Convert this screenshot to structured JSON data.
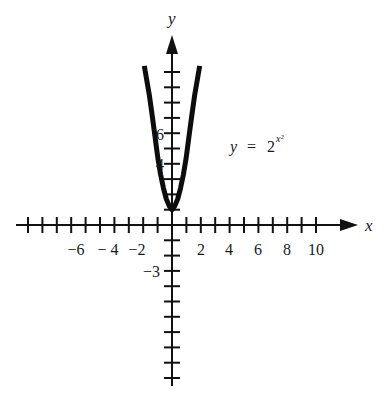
{
  "chart_data": {
    "type": "line",
    "title": "",
    "equation_label": {
      "lhs": "y",
      "eq": "=",
      "base": "2",
      "exponent": "x²"
    },
    "function": "y = 2^(x^2)",
    "xlabel": "x",
    "ylabel": "y",
    "x_tick_labels": [
      "−6",
      "− 4",
      "−2",
      "2",
      "4",
      "6",
      "8",
      "10"
    ],
    "x_tick_label_values": [
      -6,
      -4,
      -2,
      2,
      4,
      6,
      8,
      10
    ],
    "y_tick_labels": [
      "6",
      "4",
      "−3"
    ],
    "y_tick_label_values": [
      6,
      4,
      -2
    ],
    "x_ticks": [
      -10,
      -9,
      -8,
      -7,
      -6,
      -5,
      -4,
      -3,
      -2,
      -1,
      1,
      2,
      3,
      4,
      5,
      6,
      7,
      8,
      9,
      10
    ],
    "y_ticks": [
      -10,
      -9,
      -8,
      -7,
      -6,
      -5,
      -4,
      -3,
      -2,
      -1,
      1,
      2,
      3,
      4,
      5,
      6,
      7,
      8,
      9,
      10
    ],
    "xlim": [
      -10.5,
      12.5
    ],
    "ylim": [
      -10.5,
      12.5
    ],
    "grid": false,
    "legend": null,
    "series": [
      {
        "name": "y = 2^(x^2)",
        "x": [
          -1.95,
          -1.8,
          -1.6,
          -1.4,
          -1.2,
          -1.0,
          -0.8,
          -0.6,
          -0.4,
          -0.2,
          0,
          0.2,
          0.4,
          0.6,
          0.8,
          1.0,
          1.2,
          1.4,
          1.6,
          1.8,
          1.95
        ],
        "y": [
          10.4,
          9.6,
          8.5,
          7.2,
          5.8,
          4.4,
          3.3,
          2.4,
          1.7,
          1.25,
          1.0,
          1.25,
          1.7,
          2.4,
          3.3,
          4.4,
          5.8,
          7.2,
          8.5,
          9.6,
          10.4
        ]
      }
    ]
  }
}
